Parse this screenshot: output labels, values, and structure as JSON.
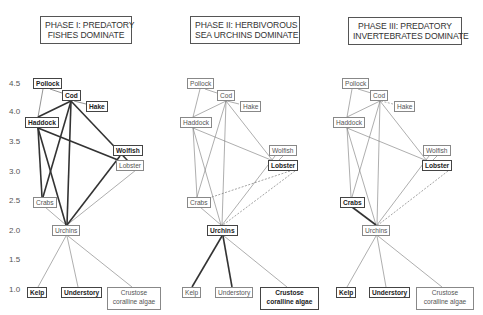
{
  "panels": [
    {
      "id": "phase1",
      "title_lines": [
        "PHASE I: PREDATORY",
        "FISHES DOMINATE"
      ],
      "nodes": {
        "pollock": {
          "label": "Pollock",
          "bold": true
        },
        "cod": {
          "label": "Cod",
          "bold": true
        },
        "hake": {
          "label": "Hake",
          "bold": true
        },
        "haddock": {
          "label": "Haddock",
          "bold": true
        },
        "wolfish": {
          "label": "Wolfish",
          "bold": true
        },
        "lobster": {
          "label": "Lobster",
          "bold": false
        },
        "crabs": {
          "label": "Crabs",
          "bold": false
        },
        "urchins": {
          "label": "Urchins",
          "bold": false
        },
        "kelp": {
          "label": "Kelp",
          "bold": true
        },
        "understory": {
          "label": "Understory",
          "bold": true
        },
        "crustose": {
          "label": "Crustose coralline algae",
          "bold": false
        }
      }
    },
    {
      "id": "phase2",
      "title_lines": [
        "PHASE II: HERBIVOROUS",
        "SEA URCHINS DOMINATE"
      ],
      "nodes": {
        "pollock": {
          "label": "Pollock",
          "bold": false
        },
        "cod": {
          "label": "Cod",
          "bold": false
        },
        "hake": {
          "label": "Hake",
          "bold": false
        },
        "haddock": {
          "label": "Haddock",
          "bold": false
        },
        "wolfish": {
          "label": "Wolfish",
          "bold": false
        },
        "lobster": {
          "label": "Lobster",
          "bold": true
        },
        "crabs": {
          "label": "Crabs",
          "bold": false
        },
        "urchins": {
          "label": "Urchins",
          "bold": true
        },
        "kelp": {
          "label": "Kelp",
          "bold": false
        },
        "understory": {
          "label": "Understory",
          "bold": false
        },
        "crustose": {
          "label": "Crustose coralline algae",
          "bold": true
        }
      }
    },
    {
      "id": "phase3",
      "title_lines": [
        "PHASE III: PREDATORY",
        "INVERTEBRATES DOMINATE"
      ],
      "nodes": {
        "pollock": {
          "label": "Pollock",
          "bold": false
        },
        "cod": {
          "label": "Cod",
          "bold": false
        },
        "hake": {
          "label": "Hake",
          "bold": false
        },
        "haddock": {
          "label": "Haddock",
          "bold": false
        },
        "wolfish": {
          "label": "Wolfish",
          "bold": false
        },
        "lobster": {
          "label": "Lobster",
          "bold": true
        },
        "crabs": {
          "label": "Crabs",
          "bold": true
        },
        "urchins": {
          "label": "Urchins",
          "bold": false
        },
        "kelp": {
          "label": "Kelp",
          "bold": true
        },
        "understory": {
          "label": "Understory",
          "bold": true
        },
        "crustose": {
          "label": "Crustose coralline algae",
          "bold": false
        }
      }
    }
  ],
  "y_axis": {
    "ticks": [
      "4.5",
      "4.0",
      "3.5",
      "3.0",
      "2.5",
      "2.0",
      "1.5",
      "1.0"
    ]
  },
  "colors": {
    "strong_edge": "#333333",
    "weak_edge": "#888888",
    "box_border_bold": "#444444",
    "box_border": "#888888"
  }
}
